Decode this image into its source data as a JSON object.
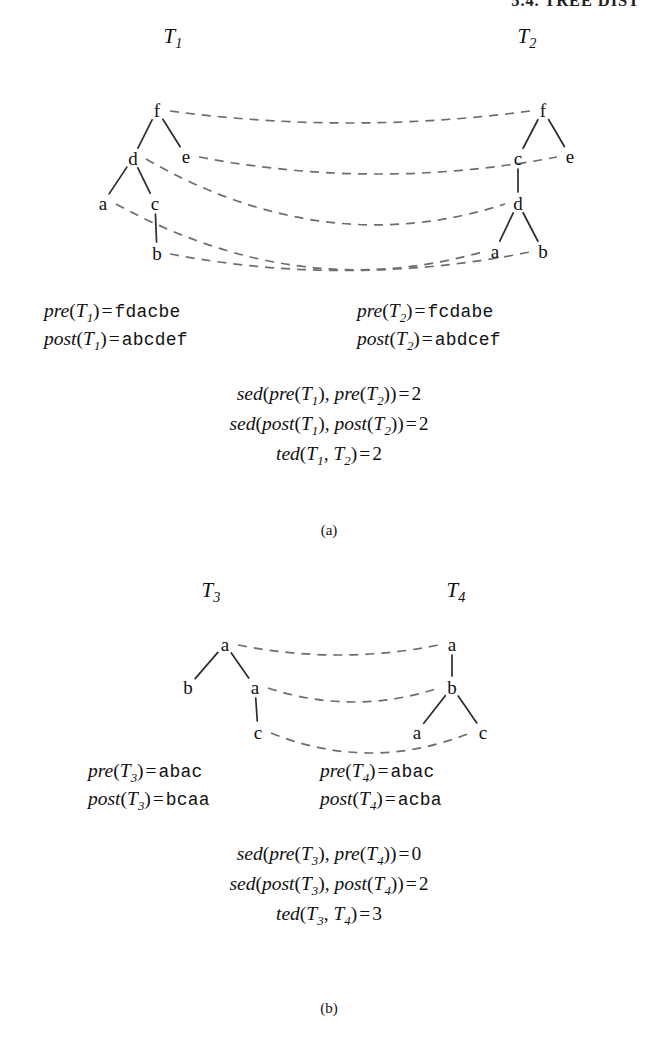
{
  "running_head": "5.4. TREE DIST",
  "figures": [
    {
      "id": "figure-a",
      "caption": "(a)",
      "trees": [
        {
          "name": "T",
          "sub": "1",
          "title_x": 173,
          "title_y": 38,
          "nodes": [
            {
              "id": "f",
              "label": "f",
              "x": 157,
              "y": 110
            },
            {
              "id": "d",
              "label": "d",
              "x": 133,
              "y": 158
            },
            {
              "id": "e",
              "label": "e",
              "x": 186,
              "y": 156
            },
            {
              "id": "a",
              "label": "a",
              "x": 103,
              "y": 203
            },
            {
              "id": "c",
              "label": "c",
              "x": 155,
              "y": 203
            },
            {
              "id": "b",
              "label": "b",
              "x": 157,
              "y": 253
            }
          ],
          "edges": [
            [
              "f",
              "d"
            ],
            [
              "f",
              "e"
            ],
            [
              "d",
              "a"
            ],
            [
              "d",
              "c"
            ],
            [
              "c",
              "b"
            ]
          ]
        },
        {
          "name": "T",
          "sub": "2",
          "title_x": 527,
          "title_y": 38,
          "nodes": [
            {
              "id": "f",
              "label": "f",
              "x": 543,
              "y": 110
            },
            {
              "id": "c",
              "label": "c",
              "x": 518,
              "y": 158
            },
            {
              "id": "e",
              "label": "e",
              "x": 570,
              "y": 156
            },
            {
              "id": "d",
              "label": "d",
              "x": 518,
              "y": 203
            },
            {
              "id": "a",
              "label": "a",
              "x": 495,
              "y": 251
            },
            {
              "id": "b",
              "label": "b",
              "x": 543,
              "y": 251
            }
          ],
          "edges": [
            [
              "f",
              "c"
            ],
            [
              "f",
              "e"
            ],
            [
              "c",
              "d"
            ],
            [
              "d",
              "a"
            ],
            [
              "d",
              "b"
            ]
          ]
        }
      ],
      "mappings": [
        {
          "from": "f",
          "to": "f"
        },
        {
          "from": "e",
          "to": "e"
        },
        {
          "from": "d",
          "to": "d"
        },
        {
          "from": "a",
          "to": "a"
        },
        {
          "from": "b",
          "to": "b"
        }
      ],
      "seq_lines": [
        {
          "side": "left",
          "fn": "pre",
          "tree": "T",
          "sub": "1",
          "value": "fdacbe"
        },
        {
          "side": "right",
          "fn": "pre",
          "tree": "T",
          "sub": "2",
          "value": "fcdabe"
        },
        {
          "side": "left",
          "fn": "post",
          "tree": "T",
          "sub": "1",
          "value": "abcdef"
        },
        {
          "side": "right",
          "fn": "post",
          "tree": "T",
          "sub": "2",
          "value": "abdcef"
        }
      ],
      "result_lines": [
        {
          "fn": "sed",
          "inner": "pre",
          "a_sub": "1",
          "b_sub": "2",
          "tree": "T",
          "value": "2"
        },
        {
          "fn": "sed",
          "inner": "post",
          "a_sub": "1",
          "b_sub": "2",
          "tree": "T",
          "value": "2"
        },
        {
          "fn": "ted",
          "inner": "",
          "a_sub": "1",
          "b_sub": "2",
          "tree": "T",
          "value": "2"
        }
      ]
    },
    {
      "id": "figure-b",
      "caption": "(b)",
      "trees": [
        {
          "name": "T",
          "sub": "3",
          "title_x": 211,
          "title_y": 32,
          "nodes": [
            {
              "id": "a1",
              "label": "a",
              "x": 225,
              "y": 84
            },
            {
              "id": "b1",
              "label": "b",
              "x": 188,
              "y": 127
            },
            {
              "id": "a2",
              "label": "a",
              "x": 255,
              "y": 127
            },
            {
              "id": "c1",
              "label": "c",
              "x": 258,
              "y": 172
            }
          ],
          "edges": [
            [
              "a1",
              "b1"
            ],
            [
              "a1",
              "a2"
            ],
            [
              "a2",
              "c1"
            ]
          ]
        },
        {
          "name": "T",
          "sub": "4",
          "title_x": 456,
          "title_y": 32,
          "nodes": [
            {
              "id": "a1",
              "label": "a",
              "x": 452,
              "y": 84
            },
            {
              "id": "b1",
              "label": "b",
              "x": 452,
              "y": 127
            },
            {
              "id": "a2",
              "label": "a",
              "x": 417,
              "y": 172
            },
            {
              "id": "c1",
              "label": "c",
              "x": 483,
              "y": 172
            }
          ],
          "edges": [
            [
              "a1",
              "b1"
            ],
            [
              "b1",
              "a2"
            ],
            [
              "b1",
              "c1"
            ]
          ]
        }
      ],
      "mappings": [
        {
          "from": "a1",
          "to": "a1"
        },
        {
          "from": "a2",
          "to": "b1"
        },
        {
          "from": "c1",
          "to": "c1"
        }
      ],
      "seq_lines": [
        {
          "side": "left",
          "fn": "pre",
          "tree": "T",
          "sub": "3",
          "value": "abac"
        },
        {
          "side": "right",
          "fn": "pre",
          "tree": "T",
          "sub": "4",
          "value": "abac"
        },
        {
          "side": "left",
          "fn": "post",
          "tree": "T",
          "sub": "3",
          "value": "bcaa"
        },
        {
          "side": "right",
          "fn": "post",
          "tree": "T",
          "sub": "4",
          "value": "acba"
        }
      ],
      "result_lines": [
        {
          "fn": "sed",
          "inner": "pre",
          "a_sub": "3",
          "b_sub": "4",
          "tree": "T",
          "value": "0"
        },
        {
          "fn": "sed",
          "inner": "post",
          "a_sub": "3",
          "b_sub": "4",
          "tree": "T",
          "value": "2"
        },
        {
          "fn": "ted",
          "inner": "",
          "a_sub": "3",
          "b_sub": "4",
          "tree": "T",
          "value": "3"
        }
      ]
    }
  ],
  "colors": {
    "ink": "#111111",
    "edge": "#2b2b2b",
    "maplink": "#6d6d6d",
    "background": "#ffffff"
  }
}
